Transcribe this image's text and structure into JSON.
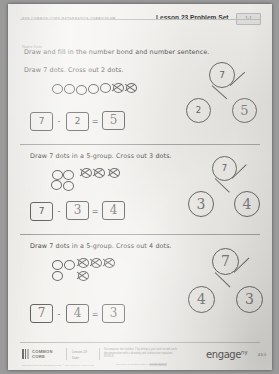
{
  "header": {
    "curriculum": "NYS COMMON CORE MATHEMATICS CURRICULUM",
    "lesson_title": "Lesson 23 Problem Set",
    "badge": "1·1"
  },
  "name_line": "Name                                                                                          Date",
  "main_instruction": "Draw and fill in the number bond and number sentence.",
  "problems": [
    {
      "prompt": "Draw 7 dots.  Cross out 2 dots.",
      "open_dots": 5,
      "crossed_dots": 2,
      "sentence": {
        "minuend": "7",
        "minus": "-",
        "subtrahend": "2",
        "equals": "=",
        "difference": "5"
      },
      "bond": {
        "total": "7",
        "part_left": "2",
        "part_right": "5"
      }
    },
    {
      "prompt": "Draw 7 dots in a 5-group.  Cross out 3 dots.",
      "open_dots": 4,
      "crossed_dots": 3,
      "sentence": {
        "minuend": "7",
        "minus": "-",
        "subtrahend": "3",
        "equals": "=",
        "difference": "4"
      },
      "bond": {
        "total": "7",
        "part_left": "3",
        "part_right": "4"
      }
    },
    {
      "prompt": "Draw 7 dots in a 5-group.  Cross out 4 dots.",
      "open_dots": 3,
      "crossed_dots": 4,
      "sentence": {
        "minuend": "7",
        "minus": "-",
        "subtrahend": "4",
        "equals": "=",
        "difference": "3"
      },
      "bond": {
        "total": "7",
        "part_left": "4",
        "part_right": "3"
      }
    }
  ],
  "footer": {
    "common_core_line1": "COMMON",
    "common_core_line2": "CORE",
    "lesson_label": "Lesson 23:",
    "date_label": "Date:",
    "description": "Decompose the number 7 by listing a part and record each decomposition with a drawing and subtraction equation.",
    "date_value": "8/19/13",
    "engage": "engage",
    "engage_sup": "ny",
    "page_number": "4.D.6",
    "license": "This work is licensed under a",
    "license_badge": "CC BY-NC-SA",
    "tiny_note": "This work is derived from Eureka Math ™ and licensed by Great Minds."
  }
}
